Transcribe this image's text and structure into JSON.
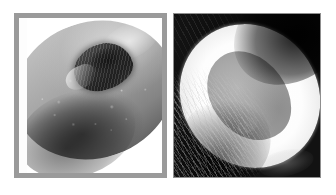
{
  "figure": {
    "caption": "",
    "background_color": "#ffffff",
    "width": 336,
    "height": 195,
    "panel_count": 2
  },
  "panels": [
    {
      "id": "left",
      "label": "",
      "subject": "halved stone fruit with pit cavity",
      "subject_icon": "stone-fruit-half-icon",
      "frame": {
        "style": "solid border with white mount",
        "border_color": "#9a9a9a",
        "border_width_px": 5,
        "mount_color": "#fdfdfd"
      },
      "rendering": "grayscale photograph",
      "tones": {
        "flesh_mid": "#9d9d9d",
        "flesh_light": "#c8c8c8",
        "pit_cavity_dark": "#242424",
        "shadow": "#4a4a4a"
      },
      "features": [
        "mid-grey speckled flesh surface",
        "dark rough pit cavity upper centre",
        "pale torn fringe beside the pit",
        "specular sheen on upper-right shoulder",
        "deep shadow along lower-left rim"
      ]
    },
    {
      "id": "right",
      "label": "",
      "subject": "halved coconut showing white flesh ring and hollow cavity",
      "subject_icon": "coconut-half-icon",
      "frame": {
        "style": "thin outline, photo bleeds to edge",
        "border_color": "#8f8f8f",
        "border_width_px": 1,
        "mount_color": "none"
      },
      "rendering": "grayscale photograph",
      "tones": {
        "husk_dark": "#0e0e0e",
        "flesh_white": "#ffffff",
        "cavity_grey": "#ababab",
        "fibre_highlight": "#cdcdcd"
      },
      "features": [
        "near-black fibrous husk background",
        "bright white flesh ring as a tilted ellipse",
        "medium-grey hollow cavity at centre",
        "coarse fibre streaks across lower-left husk",
        "dark band sweeping the top-right corner"
      ]
    }
  ]
}
